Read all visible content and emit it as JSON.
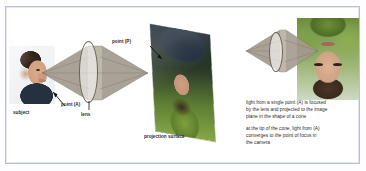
{
  "figure": {
    "type": "optics-diagram",
    "frame_color": "#b9bdd6",
    "background_color": "#ffffff",
    "cone_color": "#a79e92",
    "text_color": "#2b2b2b"
  },
  "left_panel": {
    "labels": {
      "subject": "subject",
      "point_a": "point (A)",
      "lens": "lens",
      "point_p": "point (P)",
      "projection_surface": "projection surface"
    },
    "images": {
      "subject_photo": "photo-man-profile-facing-right",
      "projection_photo": "photo-inverted-man-outdoors-tilted-plane"
    },
    "icons": {
      "pointer_a": "arrow-pointer-icon",
      "pointer_p": "arrow-pointer-icon",
      "lens_leader": "leader-line-icon",
      "bicone": "double-cone-icon",
      "lens_ellipse": "lens-ellipse-icon"
    }
  },
  "right_panel": {
    "images": {
      "inverted_photo": "photo-inverted-man-portrait"
    },
    "icons": {
      "cone": "cone-icon",
      "lens_ellipse": "lens-ellipse-icon"
    },
    "caption": {
      "paragraph_1_line_1": "light from a single point (A) is focused",
      "paragraph_1_line_2": "by the lens and projected to the image",
      "paragraph_1_line_3": "plane in the shape of a cone",
      "paragraph_2_line_1": "at the tip of the cone, light from (A)",
      "paragraph_2_line_2": "converges to the point of focus in",
      "paragraph_2_line_3": "the camera"
    }
  }
}
